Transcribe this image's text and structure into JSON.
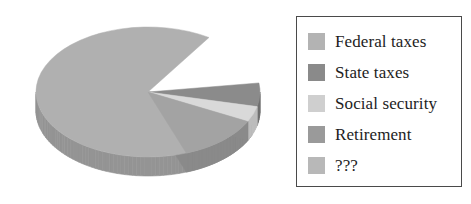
{
  "chart_data": {
    "type": "pie",
    "title": "",
    "subtitle": "",
    "xlabel": "",
    "ylabel": "",
    "grid": false,
    "legend_position": "right",
    "three_d": true,
    "categories": [
      "Federal taxes",
      "State taxes",
      "Social security",
      "Retirement",
      "???"
    ],
    "values": [
      78,
      6,
      4,
      12,
      0
    ],
    "slices": [
      {
        "label": "Federal taxes",
        "value": 78,
        "color": "#b0b0b0",
        "side_color": "#949494",
        "start_angle": 22,
        "end_angle": 303
      },
      {
        "label": "State taxes",
        "value": 6,
        "color": "#8b8b8b",
        "side_color": "#6f6f6f",
        "start_angle": 352,
        "end_angle": 373
      },
      {
        "label": "Social security",
        "value": 4,
        "color": "#d9d9d9",
        "side_color": "#bcbcbc",
        "start_angle": 373,
        "end_angle": 387
      },
      {
        "label": "Retirement",
        "value": 12,
        "color": "#a3a3a3",
        "side_color": "#8a8a8a",
        "start_angle": 387,
        "end_angle": 430
      },
      {
        "label": "???",
        "value": 0,
        "color": "#b4b4b4",
        "side_color": "#989898",
        "start_angle": 430,
        "end_angle": 430
      }
    ]
  },
  "legend": {
    "items": [
      {
        "label": "Federal taxes",
        "color": "#b3b3b3"
      },
      {
        "label": "State taxes",
        "color": "#8a8a8a"
      },
      {
        "label": "Social security",
        "color": "#cfcfcf"
      },
      {
        "label": "Retirement",
        "color": "#9a9a9a"
      },
      {
        "label": "???",
        "color": "#b8b8b8"
      }
    ]
  },
  "colors": {
    "background": "#ffffff",
    "legend_border": "#4a4a4a",
    "text": "#1d1d1d"
  }
}
